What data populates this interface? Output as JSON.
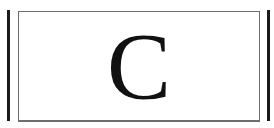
{
  "calculator": {
    "clear_key": {
      "label": "C"
    }
  },
  "colors": {
    "key_border": "#6e6e6e",
    "separator_bar": "#1a1a1a",
    "label": "#111111",
    "background": "#ffffff"
  }
}
